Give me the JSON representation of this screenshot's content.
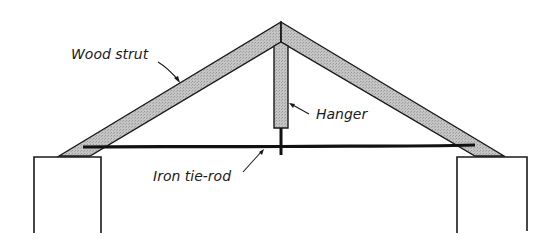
{
  "diagram": {
    "type": "roof-truss",
    "labels": {
      "wood_strut": "Wood strut",
      "hanger": "Hanger",
      "iron_tie_rod": "Iron tie-rod"
    },
    "colors": {
      "wood_fill": "#bdbdbd",
      "outline": "#1a1a1a",
      "rod": "#111111",
      "background": "#ffffff"
    }
  }
}
